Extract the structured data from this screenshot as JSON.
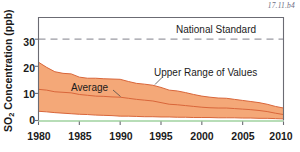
{
  "figure": {
    "id_label": "17.11.b4",
    "background_color": "#ffffff"
  },
  "axes": {
    "y_title_prefix": "SO",
    "y_title_subscript": "2",
    "y_title_suffix": " Concentration (ppb)",
    "y_ticks": [
      "0",
      "10",
      "20",
      "30"
    ],
    "x_ticks": [
      "1980",
      "1985",
      "1990",
      "1995",
      "2000",
      "2005",
      "2010"
    ],
    "frame_color": "#6b6b73",
    "baseline_color": "#9fd29f"
  },
  "annotations": {
    "national_standard": "National Standard",
    "average": "Average",
    "upper_range": "Upper Range of Values"
  },
  "colors": {
    "band_fill": "#f4a878",
    "band_line": "#d9663a",
    "standard_line": "#9a9aa2",
    "text": "#1b1b1b"
  },
  "chart_data": {
    "type": "area",
    "title": "",
    "xlabel": "",
    "ylabel": "SO2 Concentration (ppb)",
    "xlim": [
      1980,
      2010
    ],
    "ylim": [
      0,
      38
    ],
    "grid": false,
    "legend": "inline-annotations",
    "x": [
      1980,
      1981,
      1982,
      1983,
      1984,
      1985,
      1986,
      1987,
      1988,
      1989,
      1990,
      1991,
      1992,
      1993,
      1994,
      1995,
      1996,
      1997,
      1998,
      1999,
      2000,
      2001,
      2002,
      2003,
      2004,
      2005,
      2006,
      2007,
      2008,
      2009,
      2010
    ],
    "series": [
      {
        "name": "Upper Range of Values",
        "values": [
          21.5,
          19.6,
          18.0,
          17.4,
          17.2,
          16.0,
          15.6,
          15.6,
          15.4,
          15.3,
          15.2,
          14.4,
          13.7,
          13.4,
          13.0,
          12.2,
          11.2,
          10.9,
          10.3,
          9.6,
          9.0,
          8.6,
          8.3,
          8.2,
          7.8,
          7.4,
          7.0,
          6.6,
          6.0,
          5.2,
          4.6
        ]
      },
      {
        "name": "Average",
        "values": [
          11.5,
          11.2,
          10.6,
          10.4,
          10.2,
          9.6,
          9.3,
          9.0,
          8.9,
          8.7,
          8.6,
          8.2,
          7.8,
          7.5,
          7.2,
          6.6,
          6.0,
          5.8,
          5.5,
          5.2,
          4.9,
          4.7,
          4.6,
          4.6,
          4.4,
          4.2,
          4.0,
          3.7,
          3.3,
          2.7,
          2.2
        ]
      },
      {
        "name": "Lower Range of Values",
        "values": [
          3.4,
          3.2,
          2.9,
          2.7,
          2.5,
          2.3,
          2.2,
          2.0,
          1.9,
          1.8,
          1.6,
          1.6,
          1.5,
          1.4,
          1.4,
          1.3,
          1.3,
          1.2,
          1.2,
          1.1,
          1.1,
          1.1,
          1.0,
          1.0,
          1.0,
          0.9,
          0.9,
          0.8,
          0.8,
          0.7,
          0.6
        ]
      }
    ],
    "reference_lines": [
      {
        "name": "National Standard",
        "value": 30,
        "style": "dashed",
        "orientation": "horizontal"
      }
    ]
  }
}
